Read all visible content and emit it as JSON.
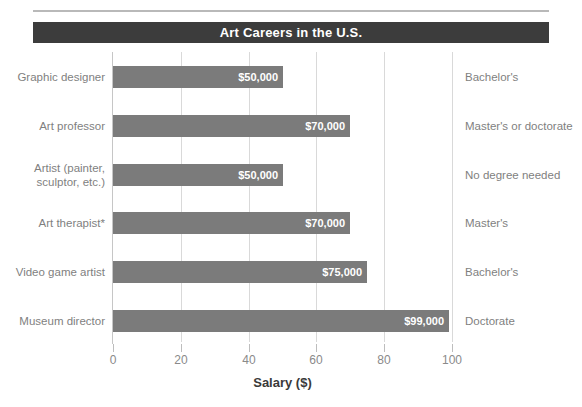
{
  "chart_data": {
    "type": "bar",
    "orientation": "horizontal",
    "title": "Art Careers in the U.S.",
    "xlabel": "Salary ($)",
    "ylabel": "",
    "xlim": [
      0,
      100
    ],
    "xticks": [
      0,
      20,
      40,
      60,
      80,
      100
    ],
    "xtick_labels": [
      "0",
      "20",
      "40",
      "60",
      "80",
      "100"
    ],
    "grid": "vertical-only",
    "legend": "none",
    "categories": [
      "Graphic designer",
      "Art professor",
      "Artist (painter, sculptor, etc.)",
      "Art therapist*",
      "Video game artist",
      "Museum director"
    ],
    "category_lines": [
      [
        "Graphic designer"
      ],
      [
        "Art professor"
      ],
      [
        "Artist (painter,",
        "sculptor, etc.)"
      ],
      [
        "Art therapist*"
      ],
      [
        "Video game artist"
      ],
      [
        "Museum director"
      ]
    ],
    "values": [
      50,
      70,
      50,
      70,
      75,
      99
    ],
    "value_labels": [
      "$50,000",
      "$70,000",
      "$50,000",
      "$70,000",
      "$75,000",
      "$99,000"
    ],
    "education_labels": [
      "Bachelor's",
      "Master's or doctorate",
      "No degree needed",
      "Master's",
      "Bachelor's",
      "Doctorate"
    ],
    "colors": {
      "bar": "#7b7b7b",
      "title_banner": "#3c3c3c",
      "title_text": "#ffffff",
      "value_text": "#ffffff",
      "label_text": "#7f7f7f",
      "gridline": "#d9d9d9",
      "axis": "#c6c6c6",
      "background": "#ffffff"
    }
  }
}
